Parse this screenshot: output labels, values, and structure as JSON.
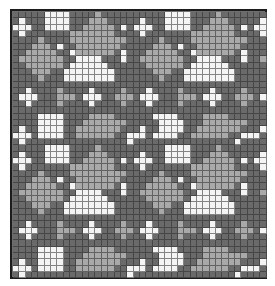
{
  "chart": {
    "title": "",
    "cols": 40,
    "rows": 42,
    "colors": {
      "d": "#6a6a6a",
      "l": "#a9a9a9",
      "w": "#f4f4f4",
      "border": "#1c1c1c"
    },
    "tile": [
      "dddddwwwwddddlddddd",
      "dwdddwwwwdddllldddd",
      "wwwddwwwwddllllldwd",
      "dwdddddddlllllllddd",
      "ddddlddddllllllllld",
      "dddllldwddllllllldd",
      "ddlllllddwlllllldwd",
      "dlllllllddwwwwdddwd",
      "ddlllllldwwwwwwdddd",
      "dddlllddwwwwwwwwddd",
      "ddddldddwwwwwwwwddd",
      "dddddddddddddddddd",
      "ddwddddlddddwddddld",
      "dwwwdddllldwwwddlll",
      "ddwddddlddddwddddld",
      "dddddddddddddddddd",
      "ddddwwwwddddlllldd",
      "ddddwwwwdddllllllld",
      "dwddwwwwddllllllldd",
      "wwwdwwwwddlllllldd",
      "dwddddddddddddddd"
    ]
  }
}
